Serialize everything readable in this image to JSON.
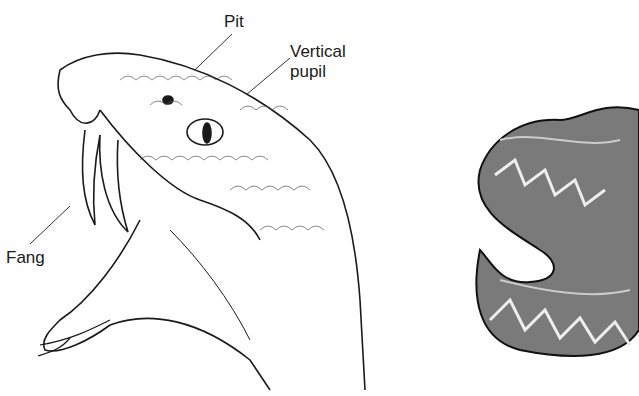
{
  "diagram": {
    "labels": {
      "pit": "Pit",
      "vertical_pupil_line1": "Vertical",
      "vertical_pupil_line2": "pupil",
      "fang": "Fang"
    }
  },
  "colors": {
    "ink": "#1a1a1a",
    "body_gray": "#7a7a7a",
    "background": "#ffffff"
  }
}
